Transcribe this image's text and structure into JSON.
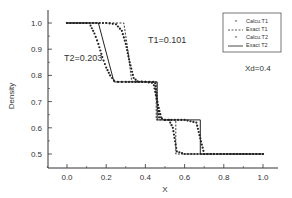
{
  "chart_data": {
    "type": "line",
    "title": "",
    "xlabel": "X",
    "ylabel": "Density",
    "xlim": [
      -0.1,
      1.1
    ],
    "ylim": [
      0.45,
      1.05
    ],
    "xticks": [
      "0.0",
      "0.2",
      "0.4",
      "0.6",
      "0.8",
      "1.0"
    ],
    "yticks": [
      "0.5",
      "0.6",
      "0.7",
      "0.8",
      "0.9",
      "1.0"
    ],
    "grid": false,
    "legend_position": "upper right",
    "annotations": [
      {
        "text": "T1=0.101",
        "x": 0.33,
        "y": 0.93
      },
      {
        "text": "T2=0.203",
        "x": 0.02,
        "y": 0.86
      },
      {
        "text": "Xd=0.4",
        "x": 0.93,
        "y": 0.87
      }
    ],
    "series": [
      {
        "name": "Calcu.T1",
        "style": "markers",
        "x": [
          0.0,
          0.1,
          0.2,
          0.25,
          0.28,
          0.3,
          0.32,
          0.34,
          0.36,
          0.4,
          0.44,
          0.46,
          0.48,
          0.5,
          0.52,
          0.54,
          0.56,
          0.6,
          0.7,
          0.8,
          0.9,
          1.0
        ],
        "y": [
          1.0,
          1.0,
          1.0,
          0.995,
          0.97,
          0.92,
          0.85,
          0.79,
          0.777,
          0.775,
          0.775,
          0.7,
          0.64,
          0.63,
          0.63,
          0.6,
          0.51,
          0.5,
          0.5,
          0.5,
          0.5,
          0.5
        ]
      },
      {
        "name": "Exact T1",
        "style": "dashed",
        "x": [
          0.0,
          0.29,
          0.31,
          0.33,
          0.455,
          0.455,
          0.555,
          0.555,
          1.0
        ],
        "y": [
          1.0,
          1.0,
          0.9,
          0.775,
          0.775,
          0.63,
          0.63,
          0.5,
          0.5
        ]
      },
      {
        "name": "Calcu.T2",
        "style": "markers",
        "x": [
          0.0,
          0.1,
          0.12,
          0.14,
          0.16,
          0.18,
          0.2,
          0.22,
          0.24,
          0.26,
          0.3,
          0.4,
          0.45,
          0.47,
          0.5,
          0.6,
          0.66,
          0.68,
          0.7,
          0.8,
          0.9,
          1.0
        ],
        "y": [
          1.0,
          1.0,
          0.99,
          0.96,
          0.92,
          0.87,
          0.83,
          0.8,
          0.78,
          0.775,
          0.775,
          0.775,
          0.77,
          0.64,
          0.63,
          0.63,
          0.62,
          0.56,
          0.5,
          0.5,
          0.5,
          0.5
        ]
      },
      {
        "name": "Exact T2",
        "style": "solid",
        "x": [
          0.0,
          0.16,
          0.24,
          0.46,
          0.46,
          0.68,
          0.68,
          1.0
        ],
        "y": [
          1.0,
          1.0,
          0.775,
          0.775,
          0.63,
          0.63,
          0.5,
          0.5
        ]
      }
    ]
  },
  "legend": {
    "items": [
      {
        "label": "Calcu.T1",
        "marker": "*"
      },
      {
        "label": "Exact T1",
        "marker": "-----"
      },
      {
        "label": "Calcu.T2",
        "marker": "*"
      },
      {
        "label": "Exact T2",
        "marker": "——"
      }
    ]
  },
  "labels": {
    "xlabel": "X",
    "ylabel": "Density",
    "t1": "T1=0.101",
    "t2": "T2=0.203",
    "xd": "Xd=0.4"
  }
}
